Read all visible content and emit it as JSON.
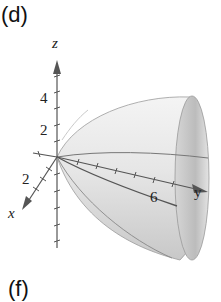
{
  "figure": {
    "panel_label": "(d)",
    "next_panel_label": "(f)",
    "axes": {
      "z": {
        "label": "z",
        "tick_labels": [
          "4",
          "2"
        ]
      },
      "x": {
        "label": "x",
        "tick_labels": [
          "2"
        ]
      },
      "y": {
        "label": "y",
        "tick_labels": [
          "6"
        ]
      }
    },
    "surface": "elliptic paraboloid opening along positive y-axis",
    "colors": {
      "surface_light": "#f2f2f2",
      "surface_dark": "#b8b8b8",
      "axis": "#555555",
      "text": "#222222"
    }
  }
}
